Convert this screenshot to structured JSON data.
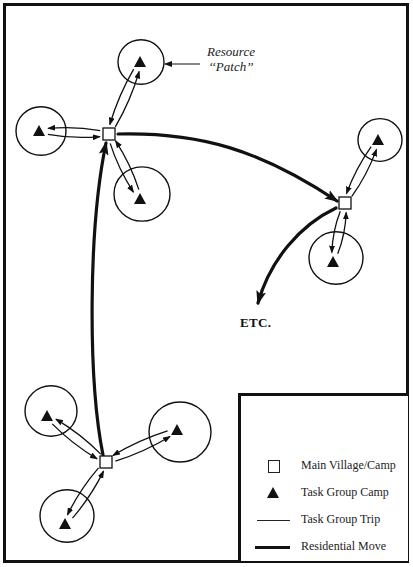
{
  "labels": {
    "resource_patch_line1": "Resource",
    "resource_patch_line2": "‘‘Patch’’",
    "etc": "ETC."
  },
  "legend": {
    "items": [
      {
        "symbol": "open-square",
        "label": "Main Village/Camp"
      },
      {
        "symbol": "filled-triangle",
        "label": "Task Group Camp"
      },
      {
        "symbol": "thin-line",
        "label": "Task Group Trip"
      },
      {
        "symbol": "thick-line",
        "label": "Residential Move"
      }
    ]
  },
  "colors": {
    "ink": "#111111",
    "background": "#ffffff"
  },
  "diagram": {
    "main_camps": [
      {
        "id": "camp-top-left",
        "x": 109,
        "y": 134
      },
      {
        "id": "camp-right",
        "x": 345,
        "y": 203
      },
      {
        "id": "camp-bottom",
        "x": 106,
        "y": 462
      }
    ],
    "task_camps": [
      {
        "id": "tg-top",
        "camp": "camp-top-left",
        "x": 140,
        "y": 62,
        "patch": {
          "cx": 141,
          "cy": 62,
          "r": 23
        }
      },
      {
        "id": "tg-left",
        "camp": "camp-top-left",
        "x": 39,
        "y": 131,
        "patch": {
          "cx": 41,
          "cy": 131,
          "r": 25
        }
      },
      {
        "id": "tg-lower",
        "camp": "camp-top-left",
        "x": 140,
        "y": 199,
        "patch": {
          "cx": 142,
          "cy": 194,
          "r": 28
        }
      },
      {
        "id": "tg-right-top",
        "camp": "camp-right",
        "x": 378,
        "y": 140,
        "patch": {
          "cx": 380,
          "cy": 140,
          "r": 22
        }
      },
      {
        "id": "tg-right-bottom",
        "camp": "camp-right",
        "x": 333,
        "y": 262,
        "patch": {
          "cx": 336,
          "cy": 258,
          "r": 27
        }
      },
      {
        "id": "tg-bottom-nw",
        "camp": "camp-bottom",
        "x": 47,
        "y": 416,
        "patch": {
          "cx": 51,
          "cy": 411,
          "r": 26
        }
      },
      {
        "id": "tg-bottom-e",
        "camp": "camp-bottom",
        "x": 177,
        "y": 430,
        "patch": {
          "cx": 180,
          "cy": 432,
          "r": 31
        }
      },
      {
        "id": "tg-bottom-s",
        "camp": "camp-bottom",
        "x": 65,
        "y": 524,
        "patch": {
          "cx": 67,
          "cy": 516,
          "r": 27
        }
      }
    ],
    "residential_moves": [
      {
        "id": "move-bottom-to-topleft",
        "path": "M103 455 C 88 380, 88 230, 106 143"
      },
      {
        "id": "move-topleft-to-right",
        "path": "M118 134 C 200 132, 260 150, 337 201"
      },
      {
        "id": "move-right-to-etc",
        "path": "M336 208 C 300 225, 270 260, 258 303"
      }
    ],
    "annotation_arrow": {
      "x1": 200,
      "y1": 64,
      "x2": 165,
      "y2": 64
    }
  }
}
